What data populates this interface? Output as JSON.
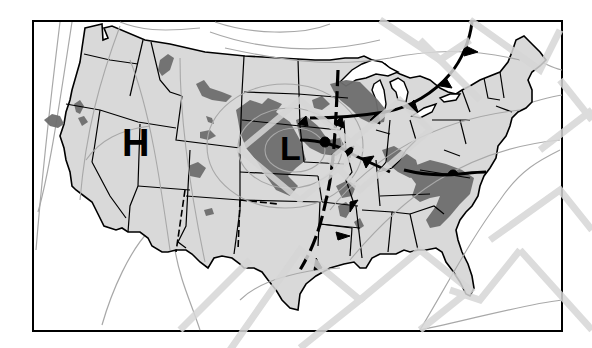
{
  "map": {
    "title": "United States surface weather map",
    "colors": {
      "background": "#ffffff",
      "land": "#d9d9d9",
      "precipitation": "#6e6e6e",
      "borders": "#000000",
      "isobars": "#a8a8a8",
      "watermark": "#d6d6d6",
      "fronts": "#000000"
    },
    "pressure_centers": [
      {
        "type": "high",
        "label": "H",
        "location": "Nevada / Great Basin"
      },
      {
        "type": "low",
        "label": "L",
        "location": "Nebraska / Central Plains"
      }
    ],
    "fronts": [
      {
        "type": "cold-front",
        "description": "Curves from Lake Superior region southeast through upper Great Lakes toward New York"
      },
      {
        "type": "stationary-front",
        "description": "Extends east from the low across Iowa/Illinois toward Ohio Valley"
      },
      {
        "type": "cold-front",
        "description": "Extends southwest from the low through Missouri, Arkansas toward Texas"
      },
      {
        "type": "warm-front",
        "description": "Across Virginia / North Carolina"
      }
    ],
    "precipitation_areas": [
      "Northern California / Oregon coast",
      "Idaho panhandle",
      "Montana / Wyoming",
      "Colorado / Utah",
      "Northern and Central Plains around the low",
      "Upper Midwest / Wisconsin",
      "Ohio Valley / Kentucky / Tennessee",
      "Virginia / North Carolina",
      "Arkansas / Mississippi"
    ]
  }
}
